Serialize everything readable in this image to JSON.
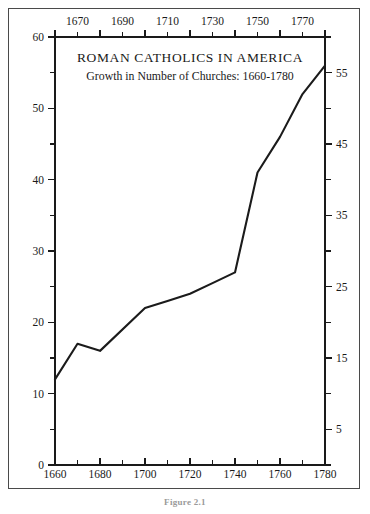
{
  "figure": {
    "caption": "Figure 2.1"
  },
  "chart_data": {
    "type": "line",
    "title": "ROMAN CATHOLICS IN AMERICA",
    "subtitle": "Growth in Number of Churches: 1660-1780",
    "xlabel": "",
    "ylabel": "",
    "xlim": [
      1660,
      1780
    ],
    "ylim": [
      0,
      60
    ],
    "grid": false,
    "legend": "none",
    "x": [
      1660,
      1670,
      1680,
      1700,
      1710,
      1720,
      1730,
      1740,
      1750,
      1760,
      1770,
      1780
    ],
    "values": [
      12,
      17,
      16,
      22,
      23,
      24,
      25.5,
      27,
      41,
      46,
      52,
      56
    ],
    "series": [
      {
        "name": "Number of Churches",
        "values": [
          12,
          17,
          16,
          22,
          23,
          24,
          25.5,
          27,
          41,
          46,
          52,
          56
        ]
      }
    ],
    "axes": {
      "bottom": {
        "major_ticks": [
          1660,
          1680,
          1700,
          1720,
          1740,
          1760,
          1780
        ],
        "major_labels": [
          "1660",
          "1680",
          "1700",
          "1720",
          "1740",
          "1760",
          "1780"
        ],
        "minor_ticks": [
          1670,
          1690,
          1710,
          1730,
          1750,
          1770
        ]
      },
      "top": {
        "major_ticks": [
          1670,
          1690,
          1710,
          1730,
          1750,
          1770
        ],
        "major_labels": [
          "1670",
          "1690",
          "1710",
          "1730",
          "1750",
          "1770"
        ],
        "minor_ticks": [
          1660,
          1680,
          1700,
          1720,
          1740,
          1760,
          1780
        ]
      },
      "left": {
        "major_ticks": [
          0,
          10,
          20,
          30,
          40,
          50,
          60
        ],
        "major_labels": [
          "0",
          "10",
          "20",
          "30",
          "40",
          "50",
          "60"
        ],
        "minor_ticks": [
          5,
          15,
          25,
          35,
          45,
          55
        ]
      },
      "right": {
        "major_ticks": [
          5,
          15,
          25,
          35,
          45,
          55
        ],
        "major_labels": [
          "5",
          "15",
          "25",
          "35",
          "45",
          "55"
        ],
        "minor_ticks": [
          0,
          10,
          20,
          30,
          40,
          50,
          60
        ]
      }
    },
    "colors": {
      "line": "#1b1b1b",
      "axis": "#1a1a1a",
      "background": "#ffffff",
      "frame": "#4a4a4a"
    }
  }
}
